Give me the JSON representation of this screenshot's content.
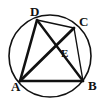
{
  "figure": {
    "background_color": "#ffffff",
    "stroke_color": "#111111",
    "circle": {
      "name": "circumscribed-circle",
      "cx": 50,
      "cy": 56,
      "r": 41,
      "stroke_width": 1.6
    },
    "points": [
      {
        "id": "A",
        "label": "A",
        "x": 20,
        "y": 81,
        "label_x": 11,
        "label_y": 91,
        "on_circle": true
      },
      {
        "id": "B",
        "label": "B",
        "x": 83,
        "y": 81,
        "label_x": 88,
        "label_y": 90,
        "on_circle": true
      },
      {
        "id": "C",
        "label": "C",
        "x": 74,
        "y": 28,
        "label_x": 79,
        "label_y": 26,
        "on_circle": true
      },
      {
        "id": "D",
        "label": "D",
        "x": 37,
        "y": 20,
        "label_x": 30,
        "label_y": 16,
        "on_circle": true
      },
      {
        "id": "E",
        "label": "E",
        "x": 55,
        "y": 50,
        "label_x": 61,
        "label_y": 57,
        "on_circle": false
      }
    ],
    "segments": [
      {
        "id": "AB",
        "from": "A",
        "to": "B",
        "stroke_width": 2.6
      },
      {
        "id": "AD",
        "from": "A",
        "to": "D",
        "stroke_width": 2.6
      },
      {
        "id": "DC",
        "from": "D",
        "to": "C",
        "stroke_width": 1.4
      },
      {
        "id": "CB",
        "from": "C",
        "to": "B",
        "stroke_width": 1.4
      },
      {
        "id": "DB",
        "from": "D",
        "to": "B",
        "stroke_width": 2.4
      },
      {
        "id": "AC",
        "from": "A",
        "to": "C",
        "stroke_width": 2.8
      }
    ],
    "diagonal_intersection": "E"
  }
}
